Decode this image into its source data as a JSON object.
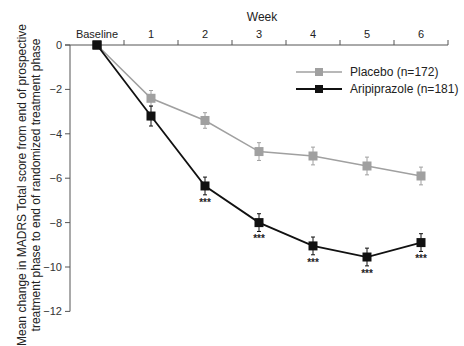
{
  "chart_data": {
    "type": "line",
    "title": "",
    "xlabel": "Week",
    "ylabel_lines": [
      "Mean change in MADRS Total score from end of prospective",
      "treatment phase to end of randomized treatment phase"
    ],
    "categories": [
      "Baseline",
      "1",
      "2",
      "3",
      "4",
      "5",
      "6"
    ],
    "x": [
      0,
      1,
      2,
      3,
      4,
      5,
      6
    ],
    "ylim": [
      -12,
      0
    ],
    "yticks": [
      0,
      -2,
      -4,
      -6,
      -8,
      -10,
      -12
    ],
    "ytick_labels": [
      "0",
      "−2",
      "−4",
      "−6",
      "−8",
      "−10",
      "−12"
    ],
    "grid": false,
    "legend_position": "top-right",
    "series": [
      {
        "name": "Placebo (n=172)",
        "color": "#a0a0a0",
        "values": [
          0,
          -2.4,
          -3.4,
          -4.8,
          -5.0,
          -5.45,
          -5.9
        ],
        "error": [
          0,
          0.35,
          0.35,
          0.4,
          0.4,
          0.4,
          0.4
        ],
        "annotations": [
          "",
          "",
          "",
          "",
          "",
          "",
          ""
        ]
      },
      {
        "name": "Aripiprazole (n=181)",
        "color": "#111111",
        "values": [
          0,
          -3.2,
          -6.35,
          -8.0,
          -9.05,
          -9.55,
          -8.9
        ],
        "error": [
          0,
          0.45,
          0.4,
          0.4,
          0.4,
          0.4,
          0.4
        ],
        "annotations": [
          "",
          "",
          "***",
          "***",
          "***",
          "***",
          "***"
        ]
      }
    ]
  }
}
